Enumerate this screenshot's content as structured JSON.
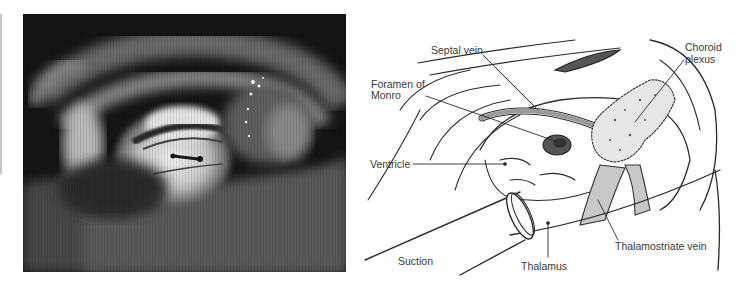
{
  "figure": {
    "left_panel": {
      "type": "endoscopic-photograph",
      "description": "Grayscale intraventricular endoscopic view"
    },
    "right_panel": {
      "type": "anatomical-illustration",
      "labels": {
        "septal_vein": "Septal vein",
        "foramen_line1": "Foramen of",
        "foramen_line2": "Monro",
        "choroid_line1": "Choroid",
        "choroid_line2": "plexus",
        "ventricle": "Ventricle",
        "suction": "Suction",
        "thalamus": "Thalamus",
        "thalamostriate_vein": "Thalamostriate vein"
      }
    },
    "colors": {
      "ink": "#2a2a2a",
      "label_text": "#3a3a3a",
      "photo_dark": "#151515",
      "photo_light": "#e8e8e8"
    }
  }
}
